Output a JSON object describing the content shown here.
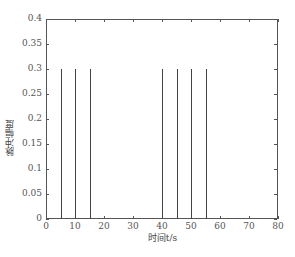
{
  "chart_data": {
    "type": "bar",
    "title": "",
    "xlabel": "时间t/s",
    "ylabel": "脉冲幅度",
    "xlim": [
      0,
      80
    ],
    "ylim": [
      0,
      0.4
    ],
    "grid": false,
    "x_ticks": [
      "0",
      "10",
      "20",
      "30",
      "40",
      "50",
      "60",
      "70",
      "80"
    ],
    "y_ticks": [
      "0",
      "0.05",
      "0.1",
      "0.15",
      "0.2",
      "0.25",
      "0.3",
      "0.35",
      "0.4"
    ],
    "series": [
      {
        "name": "pulses",
        "x": [
          5,
          10,
          15,
          40,
          45,
          50,
          55
        ],
        "values": [
          0.3,
          0.3,
          0.3,
          0.3,
          0.3,
          0.3,
          0.3
        ]
      }
    ]
  }
}
